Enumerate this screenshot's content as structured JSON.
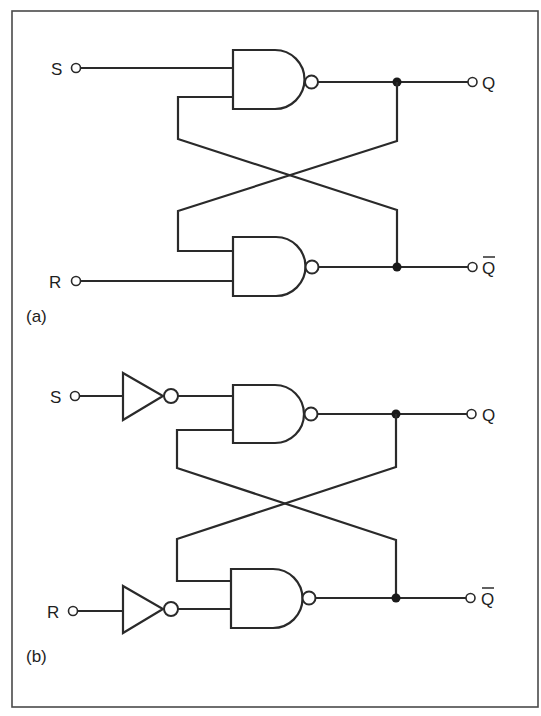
{
  "figure": {
    "colors": {
      "line": "#2a2a2a",
      "junction": "#1a1a1a",
      "background": "#ffffff",
      "frame": "#4a4a4a"
    }
  },
  "panels": [
    {
      "id": "a",
      "label": "(a)",
      "inputs": [
        {
          "name": "S",
          "label": "S"
        },
        {
          "name": "R",
          "label": "R"
        }
      ],
      "outputs": [
        {
          "name": "Q",
          "label": "Q"
        },
        {
          "name": "Q-bar",
          "label": "Q",
          "overbar": true
        }
      ],
      "components": [
        "NAND gate (upper)",
        "NAND gate (lower)"
      ],
      "input_inverters": false
    },
    {
      "id": "b",
      "label": "(b)",
      "inputs": [
        {
          "name": "S",
          "label": "S"
        },
        {
          "name": "R",
          "label": "R"
        }
      ],
      "outputs": [
        {
          "name": "Q",
          "label": "Q"
        },
        {
          "name": "Q-bar",
          "label": "Q",
          "overbar": true
        }
      ],
      "components": [
        "Inverter on S",
        "Inverter on R",
        "NAND gate (upper)",
        "NAND gate (lower)"
      ],
      "input_inverters": true
    }
  ]
}
